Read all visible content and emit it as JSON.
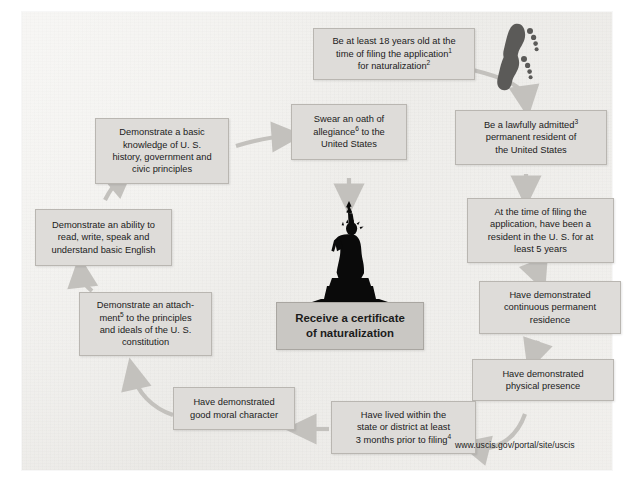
{
  "diagram": {
    "source_url": "www.uscis.gov/portal/site/uscis",
    "colors": {
      "node_fill": "#dedcd9",
      "node_border": "#b9b6b1",
      "goal_fill": "#c9c7c3",
      "arrow": "#c3c1bd",
      "paper": "#f1f0ed",
      "text": "#1b1b1b"
    },
    "icons": {
      "footprints": "footprints-icon",
      "statue": "statue-of-liberty-icon"
    },
    "nodes": [
      {
        "id": "age",
        "lines": [
          "Be at least 18 years old at the",
          "time of filing the application¹",
          "for naturalization²"
        ],
        "text": "Be at least 18 years old at the time of filing the application¹ for naturalization²"
      },
      {
        "id": "lawful-admission",
        "lines": [
          "Be a lawfully admitted³",
          "permanent resident of",
          "the United States"
        ],
        "text": "Be a lawfully admitted³ permanent resident of the United States"
      },
      {
        "id": "residency-5-years",
        "lines": [
          "At the time of filing the",
          "application, have been a",
          "resident in the U. S. for at",
          "least 5 years"
        ],
        "text": "At the time of filing the application, have been a resident in the U. S. for at least 5 years"
      },
      {
        "id": "continuous-residence",
        "lines": [
          "Have demonstrated",
          "continuous permanent",
          "residence"
        ],
        "text": "Have demonstrated continuous permanent residence"
      },
      {
        "id": "physical-presence",
        "lines": [
          "Have demonstrated",
          "physical presence"
        ],
        "text": "Have demonstrated physical presence"
      },
      {
        "id": "state-district",
        "lines": [
          "Have lived within the",
          "state or district at least",
          "3 months prior to filing⁴"
        ],
        "text": "Have lived within the state or district at least 3 months prior to filing⁴"
      },
      {
        "id": "good-moral-character",
        "lines": [
          "Have demonstrated",
          "good moral character"
        ],
        "text": "Have demonstrated good moral character"
      },
      {
        "id": "attachment-constitution",
        "lines": [
          "Demonstrate an attach-",
          "ment⁵ to the principles",
          "and ideals of the U. S.",
          "constitution"
        ],
        "text": "Demonstrate an attachment⁵ to the principles and ideals of the U. S. constitution"
      },
      {
        "id": "english-ability",
        "lines": [
          "Demonstrate an ability to",
          "read, write, speak and",
          "understand basic English"
        ],
        "text": "Demonstrate an ability to read, write, speak and understand basic English"
      },
      {
        "id": "civics-knowledge",
        "lines": [
          "Demonstrate a basic",
          "knowledge of U. S.",
          "history, government and",
          "civic principles"
        ],
        "text": "Demonstrate a basic knowledge of U. S. history, government and civic principles"
      },
      {
        "id": "oath-of-allegiance",
        "lines": [
          "Swear an oath of",
          "allegiance⁶ to the",
          "United States"
        ],
        "text": "Swear an oath of allegiance⁶ to the United States"
      },
      {
        "id": "certificate",
        "lines": [
          "Receive a certificate",
          "of naturalization"
        ],
        "text": "Receive a certificate of naturalization"
      }
    ]
  }
}
